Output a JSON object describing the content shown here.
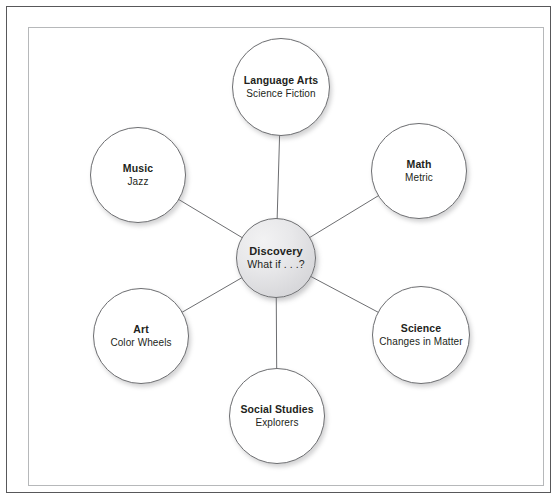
{
  "diagram": {
    "type": "concept-web",
    "center": {
      "id": "discovery",
      "title": "Discovery",
      "subtitle": "What if . . .?",
      "cx": 276,
      "cy": 258,
      "r": 40,
      "fill": "#e4e4e7",
      "stroke": "#6d6e71"
    },
    "nodes": [
      {
        "id": "language-arts",
        "title": "Language Arts",
        "subtitle": "Science Fiction",
        "cx": 281,
        "cy": 87,
        "r": 49
      },
      {
        "id": "math",
        "title": "Math",
        "subtitle": "Metric",
        "cx": 419,
        "cy": 171,
        "r": 48
      },
      {
        "id": "science",
        "title": "Science",
        "subtitle": "Changes in Matter",
        "cx": 421,
        "cy": 335,
        "r": 49
      },
      {
        "id": "social-studies",
        "title": "Social Studies",
        "subtitle": "Explorers",
        "cx": 277,
        "cy": 416,
        "r": 48
      },
      {
        "id": "art",
        "title": "Art",
        "subtitle": "Color Wheels",
        "cx": 141,
        "cy": 336,
        "r": 48
      },
      {
        "id": "music",
        "title": "Music",
        "subtitle": "Jazz",
        "cx": 138,
        "cy": 175,
        "r": 48
      }
    ],
    "edges": [
      {
        "from": "discovery",
        "to": "language-arts"
      },
      {
        "from": "discovery",
        "to": "math"
      },
      {
        "from": "discovery",
        "to": "science"
      },
      {
        "from": "discovery",
        "to": "social-studies"
      },
      {
        "from": "discovery",
        "to": "art"
      },
      {
        "from": "discovery",
        "to": "music"
      }
    ],
    "edge_color": "#6d6e71",
    "frame": {
      "outer_color": "#58585a",
      "inner_color": "#b6b8ba",
      "background": "#ffffff"
    }
  }
}
